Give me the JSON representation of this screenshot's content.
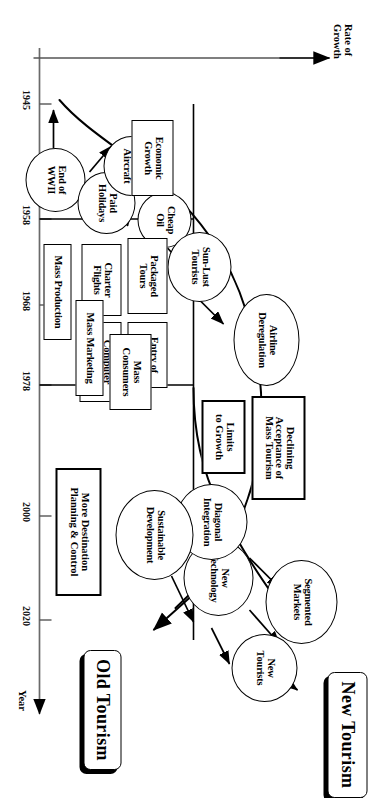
{
  "figure": {
    "type": "conceptual-timeline-diagram",
    "axis_x_label": "Year",
    "axis_y_label": "Rate of\nGrowth",
    "axis_y_label_line1": "Rate of",
    "axis_y_label_line2": "Growth",
    "year_ticks": [
      "1945",
      "1958",
      "1968",
      "1978",
      "2000",
      "2020"
    ],
    "colors": {
      "ink": "#000000",
      "paper": "#ffffff"
    }
  },
  "outcomes": [
    {
      "id": "new-tourism",
      "label": "New Tourism"
    },
    {
      "id": "old-tourism",
      "label": "Old Tourism"
    }
  ],
  "drivers": [
    {
      "id": "end-of-wwii",
      "shape": "ellipse",
      "line1": "End of",
      "line2": "WWII"
    },
    {
      "id": "paid-holidays",
      "shape": "ellipse",
      "line1": "Paid",
      "line2": "Holidays"
    },
    {
      "id": "jet-aircraft",
      "shape": "ellipse",
      "line1": "Jet",
      "line2": "Aircraft"
    },
    {
      "id": "cheap-oil",
      "shape": "ellipse",
      "line1": "Cheap",
      "line2": "Oil"
    },
    {
      "id": "sun-lust-tourists",
      "shape": "ellipse",
      "line1": "Sun-Lust",
      "line2": "Tourists"
    },
    {
      "id": "airline-deregulation",
      "shape": "ellipse",
      "line1": "Airline",
      "line2": "Deregulation"
    },
    {
      "id": "new-technology",
      "shape": "ellipse",
      "line1": "New",
      "line2": "Technology"
    },
    {
      "id": "diagonal-integration",
      "shape": "ellipse",
      "line1": "Diagonal",
      "line2": "Integration"
    },
    {
      "id": "segmented-markets",
      "shape": "ellipse",
      "line1": "Segmented",
      "line2": "Markets"
    },
    {
      "id": "sustainable-development",
      "shape": "ellipse",
      "line1": "Sustainable",
      "line2": "Development"
    },
    {
      "id": "new-tourists",
      "shape": "ellipse",
      "line1": "New",
      "line2": "Tourists"
    }
  ],
  "features": [
    {
      "id": "economic-growth",
      "line1": "Economic",
      "line2": "Growth"
    },
    {
      "id": "packaged-tours",
      "line1": "Packaged",
      "line2": "Tours"
    },
    {
      "id": "charter-flights",
      "line1": "Charter",
      "line2": "Flights"
    },
    {
      "id": "entry-of-mncs",
      "line1": "Entry of",
      "line2": "MNCs"
    },
    {
      "id": "computer-technology",
      "line1": "Computer",
      "line2": "Technology"
    },
    {
      "id": "mass-production",
      "line1": "Mass Production",
      "line2": ""
    },
    {
      "id": "mass-marketing",
      "line1": "Mass Marketing",
      "line2": ""
    },
    {
      "id": "mass-consumers",
      "line1": "Mass",
      "line2": "Consumers"
    },
    {
      "id": "limits-to-growth",
      "line1": "Limits",
      "line2": "to Growth"
    },
    {
      "id": "declining-acceptance",
      "line1": "Declining",
      "line2": "Acceptance of",
      "line3": "Mass Tourism"
    },
    {
      "id": "more-destination-planning",
      "line1": "More Destination",
      "line2": "Planning & Control"
    }
  ]
}
